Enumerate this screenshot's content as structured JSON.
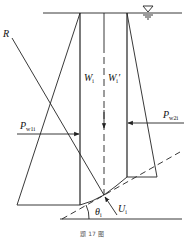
{
  "diagram": {
    "type": "slice-stability-force-diagram",
    "labels": {
      "R": "R",
      "W_main": "W",
      "W_sub": "i",
      "Wp_main": "W",
      "Wp_sub": "i",
      "Wp_prime": "′",
      "Pw1_main": "P",
      "Pw1_sub": "w1i",
      "Pw2_main": "P",
      "Pw2_sub": "w2i",
      "U_main": "U",
      "U_sub": "i",
      "theta_main": "θ",
      "theta_sub": "i"
    },
    "water_symbol": "water-level-triangle",
    "caption": "题 17 图",
    "line_color": "#222222"
  }
}
